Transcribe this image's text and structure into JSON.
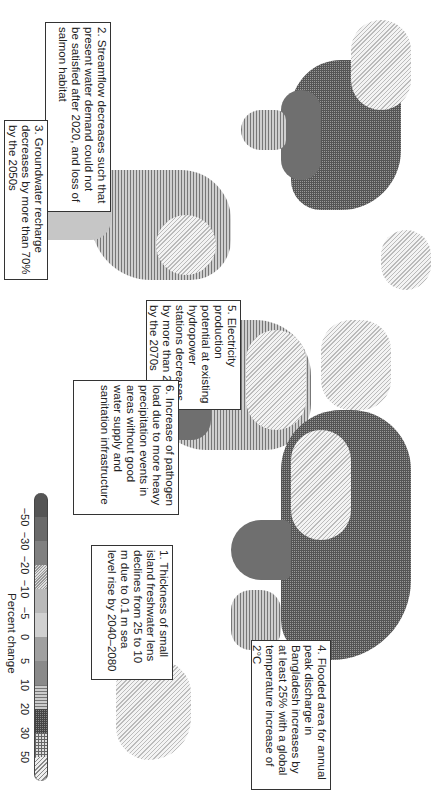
{
  "figure": {
    "type": "choropleth world map (rotated 90°)"
  },
  "annotations": [
    {
      "id": 1,
      "text": "1. Thickness of small island freshwater lens declines from 25 to 10 m due to 0.1 m sea level rise by 2040–2080"
    },
    {
      "id": 2,
      "text": "2. Streamflow decreases such that present water demand could not be satisfied after 2020, and loss of salmon habitat"
    },
    {
      "id": 3,
      "text": "3. Groundwater recharge decreases by more than 70% by the 2050s"
    },
    {
      "id": 4,
      "text": "4. Flooded area for annual peak discharge in Bangladesh increases by at least 25% with a global temperature increase of 2°C"
    },
    {
      "id": 5,
      "text": "5. Electricity production potential at existing hydropower stations decreases by more than 25% by the 2070s"
    },
    {
      "id": 6,
      "text": "6. Increase of pathogen load due to more heavy precipitation events in areas without good water supply and sanitation infrastructure"
    }
  ],
  "legend": {
    "title": "Percent change",
    "ticks": [
      "−50",
      "−30",
      "−20",
      "−10",
      "−5",
      "0",
      "5",
      "10",
      "20",
      "30",
      "50"
    ],
    "classes": [
      {
        "range": "< −50",
        "style": "dark arrow"
      },
      {
        "range": "−50 to −30",
        "style": "dark grey"
      },
      {
        "range": "−30 to −20",
        "style": "mid-dark grey"
      },
      {
        "range": "−20 to −10",
        "style": "dotted"
      },
      {
        "range": "−10 to −5",
        "style": "light grey"
      },
      {
        "range": "−5 to 0",
        "style": "lighter grey"
      },
      {
        "range": "0 to 5",
        "style": "mid grey"
      },
      {
        "range": "5 to 10",
        "style": "dark grey"
      },
      {
        "range": "10 to 20",
        "style": "horizontal lines"
      },
      {
        "range": "20 to 30",
        "style": "cross-hatch dark"
      },
      {
        "range": "30 to 50",
        "style": "grid"
      },
      {
        "range": "> 50",
        "style": "diagonal hatch arrow"
      }
    ]
  }
}
